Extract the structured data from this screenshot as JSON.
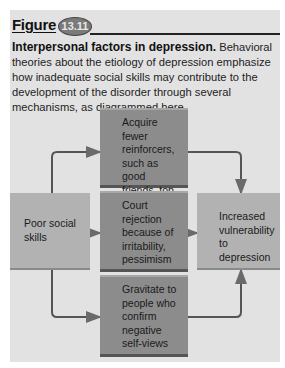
{
  "figure": {
    "label": "Figure",
    "number": "13.11"
  },
  "caption": {
    "title": "Interpersonal factors in depression.",
    "body": " Behavioral theories about the etiology of depression emphasize how inadequate social skills may contribute to the development of the disorder through several mechanisms, as diagrammed here."
  },
  "diagram": {
    "source": {
      "label": "Poor social skills"
    },
    "mechanisms": [
      {
        "label": "Acquire fewer reinforcers, such as good friends, top jobs"
      },
      {
        "label": "Court rejection because of irritability, pessimism"
      },
      {
        "label": "Gravitate to people who confirm negative self-views"
      }
    ],
    "outcome": {
      "label": "Increased vulnerability to depression"
    }
  },
  "colors": {
    "panel": "#e2e2e2",
    "center_box": "#8c8c8c",
    "side_box": "#b2b2b2",
    "arrow": "#5a5a5a"
  }
}
